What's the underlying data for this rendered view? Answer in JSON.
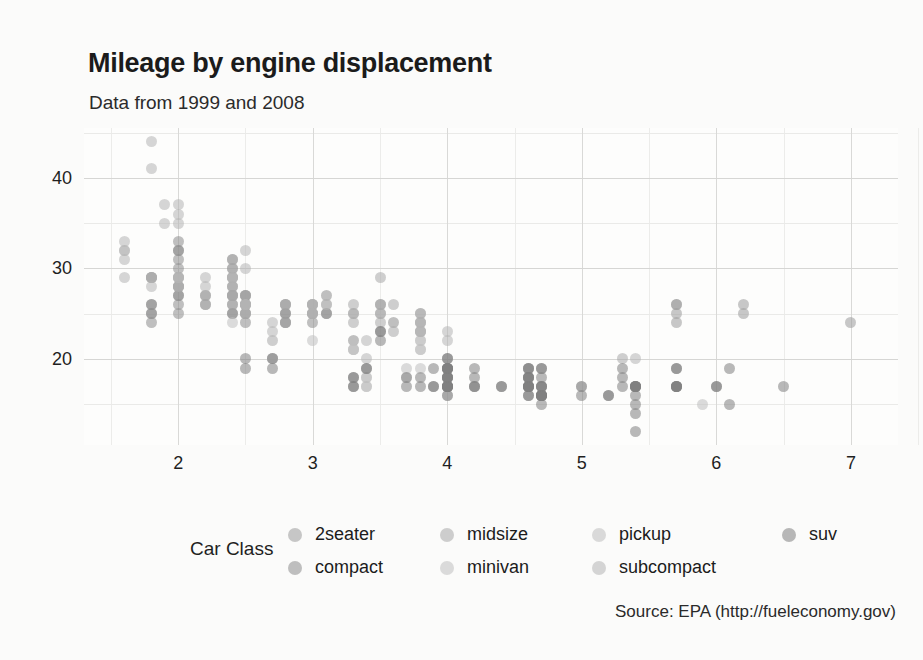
{
  "chart_data": {
    "type": "scatter",
    "title": "Mileage by engine displacement",
    "subtitle": "Data from 1999 and 2008",
    "caption": "Source: EPA (http://fueleconomy.gov)",
    "xlabel": "",
    "ylabel": "",
    "xlim": [
      1.3,
      7.35
    ],
    "ylim": [
      10.5,
      45.5
    ],
    "xticks": [
      2,
      3,
      4,
      5,
      6,
      7
    ],
    "yticks": [
      20,
      30,
      40
    ],
    "xtick_labels": [
      "2",
      "3",
      "4",
      "5",
      "6",
      "7"
    ],
    "ytick_labels": [
      "20",
      "30",
      "40"
    ],
    "grid": true,
    "legend_position": "bottom",
    "legend_title": "Car Class",
    "point_opacity": 0.55,
    "point_size": 11,
    "series": [
      {
        "name": "2seater",
        "color": "#9a9a9a",
        "points": [
          [
            5.7,
            26
          ],
          [
            5.7,
            25
          ],
          [
            5.7,
            26
          ],
          [
            5.7,
            24
          ],
          [
            6.2,
            26
          ],
          [
            6.2,
            25
          ],
          [
            7.0,
            24
          ]
        ]
      },
      {
        "name": "compact",
        "color": "#8d8d8d",
        "points": [
          [
            1.8,
            29
          ],
          [
            1.8,
            29
          ],
          [
            2.0,
            31
          ],
          [
            2.0,
            30
          ],
          [
            2.8,
            26
          ],
          [
            2.8,
            26
          ],
          [
            3.1,
            27
          ],
          [
            1.8,
            26
          ],
          [
            1.8,
            25
          ],
          [
            2.0,
            28
          ],
          [
            2.0,
            27
          ],
          [
            2.8,
            25
          ],
          [
            2.8,
            25
          ],
          [
            3.1,
            25
          ],
          [
            3.1,
            25
          ],
          [
            2.4,
            27
          ],
          [
            2.4,
            25
          ],
          [
            2.5,
            24
          ],
          [
            2.5,
            25
          ],
          [
            3.3,
            22
          ],
          [
            2.0,
            33
          ],
          [
            2.0,
            32
          ],
          [
            2.0,
            32
          ],
          [
            2.0,
            29
          ],
          [
            2.5,
            26
          ],
          [
            2.5,
            25
          ],
          [
            2.2,
            26
          ],
          [
            2.2,
            27
          ],
          [
            2.4,
            26
          ],
          [
            2.4,
            25
          ],
          [
            3.0,
            24
          ],
          [
            3.0,
            25
          ],
          [
            3.5,
            26
          ],
          [
            3.6,
            24
          ],
          [
            2.4,
            31
          ],
          [
            2.4,
            30
          ],
          [
            2.4,
            29
          ],
          [
            2.4,
            28
          ],
          [
            2.5,
            27
          ],
          [
            2.5,
            27
          ],
          [
            1.8,
            26
          ],
          [
            1.8,
            25
          ],
          [
            1.8,
            24
          ],
          [
            2.0,
            26
          ],
          [
            2.0,
            25
          ],
          [
            2.0,
            28
          ],
          [
            2.0,
            27
          ],
          [
            2.8,
            24
          ],
          [
            2.8,
            24
          ]
        ]
      },
      {
        "name": "midsize",
        "color": "#a8a8a8",
        "points": [
          [
            2.4,
            29
          ],
          [
            2.4,
            27
          ],
          [
            3.1,
            26
          ],
          [
            3.5,
            29
          ],
          [
            2.4,
            31
          ],
          [
            2.4,
            30
          ],
          [
            3.0,
            26
          ],
          [
            3.3,
            26
          ],
          [
            2.4,
            27
          ],
          [
            2.4,
            26
          ],
          [
            3.0,
            25
          ],
          [
            3.3,
            25
          ],
          [
            3.8,
            24
          ],
          [
            3.8,
            25
          ],
          [
            5.3,
            20
          ],
          [
            2.5,
            27
          ],
          [
            2.5,
            26
          ],
          [
            2.5,
            26
          ],
          [
            3.5,
            25
          ],
          [
            3.5,
            26
          ],
          [
            3.0,
            25
          ],
          [
            3.3,
            24
          ],
          [
            3.6,
            26
          ],
          [
            3.8,
            25
          ],
          [
            2.4,
            28
          ],
          [
            2.4,
            27
          ],
          [
            3.3,
            25
          ],
          [
            3.5,
            24
          ],
          [
            2.2,
            26
          ],
          [
            2.2,
            27
          ],
          [
            3.0,
            26
          ],
          [
            3.8,
            24
          ],
          [
            3.8,
            23
          ],
          [
            1.8,
            29
          ],
          [
            2.0,
            28
          ],
          [
            2.8,
            24
          ],
          [
            3.6,
            23
          ],
          [
            3.0,
            26
          ],
          [
            3.5,
            25
          ],
          [
            2.7,
            22
          ]
        ]
      },
      {
        "name": "minivan",
        "color": "#c0c0c0",
        "points": [
          [
            2.4,
            24
          ],
          [
            3.0,
            22
          ],
          [
            3.3,
            21
          ],
          [
            3.3,
            21
          ],
          [
            3.8,
            22
          ],
          [
            3.8,
            22
          ],
          [
            3.8,
            21
          ],
          [
            3.8,
            19
          ],
          [
            4.0,
            18
          ],
          [
            3.3,
            21
          ],
          [
            3.8,
            21
          ]
        ]
      },
      {
        "name": "pickup",
        "color": "#bdbdbd",
        "points": [
          [
            3.7,
            19
          ],
          [
            3.7,
            18
          ],
          [
            4.0,
            17
          ],
          [
            4.0,
            19
          ],
          [
            4.0,
            19
          ],
          [
            4.0,
            17
          ],
          [
            4.6,
            19
          ],
          [
            4.6,
            19
          ],
          [
            4.6,
            17
          ],
          [
            5.4,
            17
          ],
          [
            2.7,
            20
          ],
          [
            2.7,
            20
          ],
          [
            3.4,
            18
          ],
          [
            3.4,
            17
          ],
          [
            4.0,
            17
          ],
          [
            4.7,
            16
          ],
          [
            4.7,
            16
          ],
          [
            4.7,
            17
          ],
          [
            5.7,
            17
          ],
          [
            5.7,
            17
          ],
          [
            2.7,
            20
          ],
          [
            3.4,
            18
          ],
          [
            3.4,
            17
          ],
          [
            4.0,
            17
          ],
          [
            4.0,
            16
          ],
          [
            4.0,
            18
          ],
          [
            4.6,
            17
          ],
          [
            5.0,
            17
          ],
          [
            4.2,
            17
          ],
          [
            4.7,
            16
          ],
          [
            5.7,
            17
          ],
          [
            5.9,
            15
          ],
          [
            4.6,
            17
          ]
        ]
      },
      {
        "name": "subcompact",
        "color": "#b5b5b5",
        "points": [
          [
            1.8,
            44
          ],
          [
            1.8,
            41
          ],
          [
            1.9,
            35
          ],
          [
            1.9,
            37
          ],
          [
            2.0,
            35
          ],
          [
            2.0,
            37
          ],
          [
            2.0,
            36
          ],
          [
            2.5,
            32
          ],
          [
            2.5,
            30
          ],
          [
            2.8,
            26
          ],
          [
            3.1,
            26
          ],
          [
            1.6,
            33
          ],
          [
            1.6,
            32
          ],
          [
            1.6,
            32
          ],
          [
            1.6,
            31
          ],
          [
            1.6,
            29
          ],
          [
            1.8,
            28
          ],
          [
            1.8,
            29
          ],
          [
            2.0,
            29
          ],
          [
            2.0,
            29
          ],
          [
            2.2,
            29
          ],
          [
            2.2,
            28
          ],
          [
            2.5,
            26
          ],
          [
            2.5,
            26
          ],
          [
            3.0,
            26
          ],
          [
            3.0,
            25
          ],
          [
            3.8,
            23
          ],
          [
            3.8,
            23
          ],
          [
            4.0,
            23
          ],
          [
            4.0,
            22
          ],
          [
            2.4,
            29
          ],
          [
            2.4,
            29
          ],
          [
            3.4,
            22
          ],
          [
            3.4,
            20
          ],
          [
            5.4,
            20
          ],
          [
            5.4,
            17
          ],
          [
            2.0,
            29
          ],
          [
            2.0,
            28
          ],
          [
            2.5,
            26
          ],
          [
            2.5,
            25
          ],
          [
            3.8,
            24
          ],
          [
            3.8,
            23
          ],
          [
            2.7,
            23
          ],
          [
            2.7,
            24
          ]
        ]
      },
      {
        "name": "suv",
        "color": "#7f7f7f",
        "points": [
          [
            4.0,
            19
          ],
          [
            4.0,
            20
          ],
          [
            4.6,
            19
          ],
          [
            4.6,
            19
          ],
          [
            4.6,
            18
          ],
          [
            5.4,
            17
          ],
          [
            5.4,
            17
          ],
          [
            4.0,
            17
          ],
          [
            4.0,
            17
          ],
          [
            4.7,
            15
          ],
          [
            4.7,
            16
          ],
          [
            4.7,
            16
          ],
          [
            5.7,
            17
          ],
          [
            5.7,
            17
          ],
          [
            6.1,
            15
          ],
          [
            4.0,
            17
          ],
          [
            4.0,
            17
          ],
          [
            4.6,
            16
          ],
          [
            5.0,
            16
          ],
          [
            4.2,
            17
          ],
          [
            4.4,
            17
          ],
          [
            4.6,
            16
          ],
          [
            5.4,
            12
          ],
          [
            5.4,
            14
          ],
          [
            4.0,
            19
          ],
          [
            4.0,
            18
          ],
          [
            4.6,
            17
          ],
          [
            4.6,
            18
          ],
          [
            5.4,
            17
          ],
          [
            3.3,
            17
          ],
          [
            3.3,
            17
          ],
          [
            4.0,
            16
          ],
          [
            4.0,
            17
          ],
          [
            4.7,
            17
          ],
          [
            4.7,
            16
          ],
          [
            5.7,
            17
          ],
          [
            6.0,
            17
          ],
          [
            3.7,
            17
          ],
          [
            3.7,
            18
          ],
          [
            3.9,
            17
          ],
          [
            3.9,
            17
          ],
          [
            4.7,
            16
          ],
          [
            4.7,
            16
          ],
          [
            4.7,
            17
          ],
          [
            5.2,
            16
          ],
          [
            5.2,
            16
          ],
          [
            3.9,
            19
          ],
          [
            4.2,
            18
          ],
          [
            4.2,
            17
          ],
          [
            4.6,
            17
          ],
          [
            4.6,
            17
          ],
          [
            5.4,
            16
          ],
          [
            5.4,
            15
          ],
          [
            4.0,
            18
          ],
          [
            4.0,
            18
          ],
          [
            4.6,
            17
          ],
          [
            4.6,
            17
          ],
          [
            5.4,
            17
          ],
          [
            6.5,
            17
          ],
          [
            4.0,
            20
          ],
          [
            4.2,
            19
          ],
          [
            4.4,
            17
          ],
          [
            4.6,
            18
          ],
          [
            4.6,
            18
          ],
          [
            5.0,
            17
          ],
          [
            5.3,
            17
          ],
          [
            5.3,
            18
          ],
          [
            5.3,
            19
          ],
          [
            5.7,
            17
          ],
          [
            6.0,
            17
          ],
          [
            3.3,
            18
          ],
          [
            3.3,
            18
          ],
          [
            3.8,
            17
          ],
          [
            3.8,
            18
          ],
          [
            4.0,
            17
          ],
          [
            4.0,
            19
          ],
          [
            4.7,
            16
          ],
          [
            4.7,
            17
          ],
          [
            5.4,
            17
          ],
          [
            2.5,
            20
          ],
          [
            2.5,
            19
          ],
          [
            3.5,
            22
          ],
          [
            3.5,
            23
          ],
          [
            3.5,
            23
          ],
          [
            2.7,
            19
          ],
          [
            2.7,
            20
          ],
          [
            3.4,
            19
          ],
          [
            3.4,
            19
          ],
          [
            4.0,
            19
          ],
          [
            4.0,
            18
          ],
          [
            4.0,
            19
          ],
          [
            4.7,
            19
          ],
          [
            4.7,
            19
          ],
          [
            4.7,
            18
          ],
          [
            5.7,
            19
          ],
          [
            5.7,
            19
          ],
          [
            6.1,
            19
          ]
        ]
      }
    ]
  },
  "axis": {
    "x_ticks": [
      {
        "label": "2",
        "value": 2
      },
      {
        "label": "3",
        "value": 3
      },
      {
        "label": "4",
        "value": 4
      },
      {
        "label": "5",
        "value": 5
      },
      {
        "label": "6",
        "value": 6
      },
      {
        "label": "7",
        "value": 7
      }
    ],
    "y_ticks": [
      {
        "label": "40",
        "value": 40
      },
      {
        "label": "30",
        "value": 30
      },
      {
        "label": "20",
        "value": 20
      }
    ]
  },
  "legend": {
    "title": "Car Class",
    "items": [
      {
        "label": "2seater",
        "color": "#9a9a9a"
      },
      {
        "label": "compact",
        "color": "#8d8d8d"
      },
      {
        "label": "midsize",
        "color": "#a8a8a8"
      },
      {
        "label": "minivan",
        "color": "#c0c0c0"
      },
      {
        "label": "pickup",
        "color": "#bdbdbd"
      },
      {
        "label": "subcompact",
        "color": "#b5b5b5"
      },
      {
        "label": "suv",
        "color": "#7f7f7f"
      }
    ]
  }
}
